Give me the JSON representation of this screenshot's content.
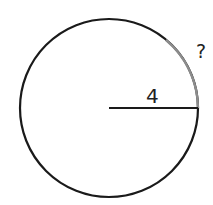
{
  "diagram": {
    "type": "circle-arc",
    "radius_label": "4",
    "arc_label": "?",
    "colors": {
      "circle": "#1a1a1a",
      "arc_highlight": "#8c8c8c",
      "radius": "#1a1a1a"
    }
  }
}
